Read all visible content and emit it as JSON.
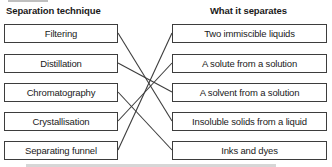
{
  "headings": {
    "left": "Separation technique",
    "right": "What it separates"
  },
  "left_items": [
    {
      "label": "Filtering",
      "top": 24
    },
    {
      "label": "Distillation",
      "top": 54
    },
    {
      "label": "Chromatography",
      "top": 83
    },
    {
      "label": "Crystallisation",
      "top": 112
    },
    {
      "label": "Separating funnel",
      "top": 141
    }
  ],
  "right_items": [
    {
      "label": "Two immiscible liquids",
      "top": 24
    },
    {
      "label": "A solute from a solution",
      "top": 54
    },
    {
      "label": "A solvent from a solution",
      "top": 83
    },
    {
      "label": "Insoluble solids from a liquid",
      "top": 112
    },
    {
      "label": "Inks and dyes",
      "top": 141
    }
  ],
  "connections": [
    {
      "from": "Filtering",
      "to": "Insoluble solids from a liquid",
      "x1": 118,
      "y1": 33,
      "x2": 172,
      "y2": 121
    },
    {
      "from": "Distillation",
      "to": "A solvent from a solution",
      "x1": 118,
      "y1": 63,
      "x2": 172,
      "y2": 92
    },
    {
      "from": "Chromatography",
      "to": "Inks and dyes",
      "x1": 118,
      "y1": 92,
      "x2": 172,
      "y2": 150
    },
    {
      "from": "Crystallisation",
      "to": "A solute from a solution",
      "x1": 118,
      "y1": 121,
      "x2": 172,
      "y2": 63
    },
    {
      "from": "Separating funnel",
      "to": "Two immiscible liquids",
      "x1": 118,
      "y1": 150,
      "x2": 172,
      "y2": 33
    }
  ],
  "colors": {
    "box_border": "#3d3d3d",
    "line": "#3d3d3d",
    "text": "#1a1a1a",
    "background": "#ffffff"
  }
}
